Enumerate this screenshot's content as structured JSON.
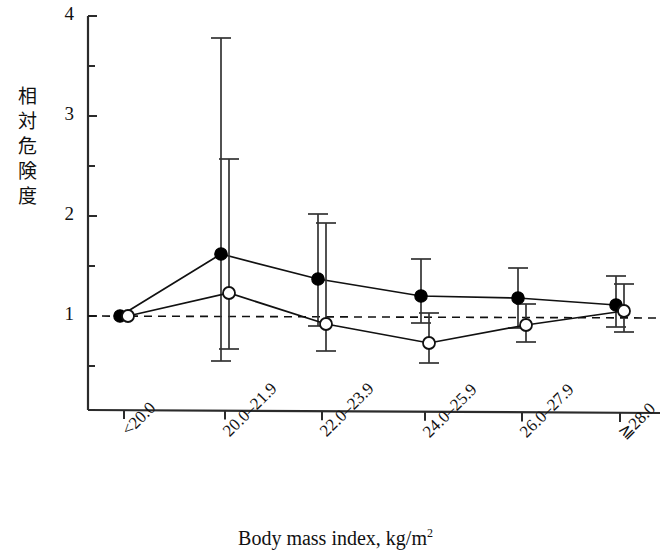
{
  "chart_data": {
    "type": "line",
    "title": "",
    "xlabel": "Body mass index, kg/m2",
    "xlabel_base": "Body mass index, kg/m",
    "xlabel_sup": "2",
    "ylabel": "相対危険度",
    "ylabel_chars": "相\n対\n危\n険\n度",
    "categories": [
      "<20.0",
      "20.0–21.9",
      "22.0–23.9",
      "24.0–25.9",
      "26.0–27.9",
      "≧28.0"
    ],
    "ylim": [
      0,
      4
    ],
    "yticks": [
      1,
      2,
      3,
      4
    ],
    "ytick_labels": [
      "1",
      "2",
      "3",
      "4"
    ],
    "yminor_ticks": [
      0.5,
      1.5,
      2.5,
      3.5
    ],
    "grid": false,
    "reference_line": {
      "value": 1.0,
      "style": "dashed"
    },
    "legend_position": "none",
    "series": [
      {
        "name": "filled",
        "marker": "filled-circle",
        "color": "#000000",
        "values": [
          1.0,
          1.62,
          1.37,
          1.2,
          1.18,
          1.11
        ],
        "ci_lower": [
          1.0,
          0.55,
          0.9,
          0.93,
          0.88,
          0.89
        ],
        "ci_upper": [
          1.0,
          3.78,
          2.02,
          1.57,
          1.48,
          1.4
        ]
      },
      {
        "name": "open",
        "marker": "open-circle",
        "color": "#000000",
        "values": [
          1.0,
          1.23,
          0.92,
          0.73,
          0.91,
          1.05
        ],
        "ci_lower": [
          1.0,
          0.67,
          0.65,
          0.53,
          0.74,
          0.84
        ],
        "ci_upper": [
          1.0,
          2.57,
          1.93,
          1.03,
          1.12,
          1.32
        ]
      }
    ]
  },
  "axis": {
    "y_label_text": "相対危険度",
    "x_title_main": "Body mass index, kg/m",
    "x_title_sup": "2"
  }
}
